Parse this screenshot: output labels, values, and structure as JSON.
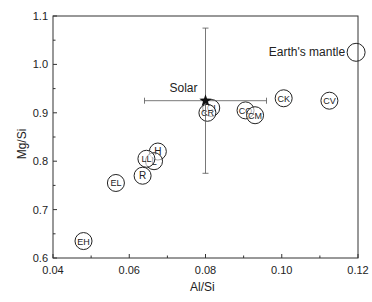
{
  "chart_data": {
    "type": "scatter",
    "title": "",
    "xlabel": "Al/Si",
    "ylabel": "Mg/Si",
    "xlim": [
      0.04,
      0.12
    ],
    "ylim": [
      0.6,
      1.1
    ],
    "xticks": [
      "0.04",
      "0.06",
      "0.08",
      "0.10",
      "0.12"
    ],
    "yticks": [
      "0.6",
      "0.7",
      "0.8",
      "0.9",
      "1.0",
      "1.1"
    ],
    "grid": false,
    "legend": null,
    "points": [
      {
        "label": "CI",
        "x": 0.0815,
        "y": 0.91
      },
      {
        "label": "CR",
        "x": 0.0805,
        "y": 0.9
      },
      {
        "label": "CO",
        "x": 0.0905,
        "y": 0.905
      },
      {
        "label": "CM",
        "x": 0.093,
        "y": 0.895
      },
      {
        "label": "CK",
        "x": 0.1005,
        "y": 0.93
      },
      {
        "label": "CV",
        "x": 0.1125,
        "y": 0.925
      },
      {
        "label": "H",
        "x": 0.0675,
        "y": 0.82
      },
      {
        "label": "L",
        "x": 0.0665,
        "y": 0.8
      },
      {
        "label": "LL",
        "x": 0.0645,
        "y": 0.805
      },
      {
        "label": "R",
        "x": 0.0635,
        "y": 0.77
      },
      {
        "label": "EL",
        "x": 0.0565,
        "y": 0.755
      },
      {
        "label": "EH",
        "x": 0.048,
        "y": 0.635
      }
    ],
    "reference_points": [
      {
        "label": "Solar",
        "x": 0.08,
        "y": 0.925,
        "marker": "star",
        "xerr": [
          0.064,
          0.096
        ],
        "yerr": [
          0.775,
          1.075
        ]
      },
      {
        "label": "Earth's mantle",
        "x": 0.1195,
        "y": 1.025,
        "marker": "open-circle"
      }
    ]
  },
  "labels": {
    "x_axis": "Al/Si",
    "y_axis": "Mg/Si",
    "solar": "Solar",
    "earth": "Earth's mantle"
  }
}
